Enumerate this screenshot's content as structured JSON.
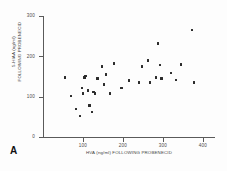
{
  "panel": {
    "label": "A"
  },
  "chart_data": {
    "type": "scatter",
    "title": "",
    "xlabel": "HVA (ng/ml) FOLLOWING PROBENECID",
    "ylabel_line1": "5-HIAA (ng/ml)",
    "ylabel_line2": "FOLLOWING PROBENECID",
    "xlim": [
      0,
      430
    ],
    "ylim": [
      0,
      300
    ],
    "xticks": [
      100,
      200,
      300,
      400
    ],
    "xtick_labels": [
      "100",
      "200",
      "300",
      "400"
    ],
    "yticks": [
      0,
      100,
      200,
      300
    ],
    "ytick_labels": [
      "0",
      "100",
      "200",
      "300"
    ],
    "grid": false,
    "legend": "none",
    "marker": "square",
    "marker_color": "#2b2b2b",
    "n_points": 33,
    "points": [
      {
        "x": 55,
        "y": 148
      },
      {
        "x": 70,
        "y": 102
      },
      {
        "x": 82,
        "y": 70
      },
      {
        "x": 92,
        "y": 52
      },
      {
        "x": 97,
        "y": 122
      },
      {
        "x": 100,
        "y": 108
      },
      {
        "x": 104,
        "y": 148
      },
      {
        "x": 106,
        "y": 152
      },
      {
        "x": 112,
        "y": 115
      },
      {
        "x": 116,
        "y": 78
      },
      {
        "x": 122,
        "y": 62
      },
      {
        "x": 126,
        "y": 112
      },
      {
        "x": 130,
        "y": 108
      },
      {
        "x": 136,
        "y": 145
      },
      {
        "x": 148,
        "y": 175
      },
      {
        "x": 152,
        "y": 130
      },
      {
        "x": 158,
        "y": 155
      },
      {
        "x": 168,
        "y": 108
      },
      {
        "x": 178,
        "y": 182
      },
      {
        "x": 196,
        "y": 122
      },
      {
        "x": 215,
        "y": 140
      },
      {
        "x": 240,
        "y": 135
      },
      {
        "x": 248,
        "y": 175
      },
      {
        "x": 262,
        "y": 190
      },
      {
        "x": 268,
        "y": 135
      },
      {
        "x": 282,
        "y": 148
      },
      {
        "x": 288,
        "y": 232
      },
      {
        "x": 292,
        "y": 178
      },
      {
        "x": 296,
        "y": 145
      },
      {
        "x": 320,
        "y": 158
      },
      {
        "x": 332,
        "y": 142
      },
      {
        "x": 345,
        "y": 180
      },
      {
        "x": 372,
        "y": 265
      },
      {
        "x": 378,
        "y": 135
      }
    ]
  }
}
